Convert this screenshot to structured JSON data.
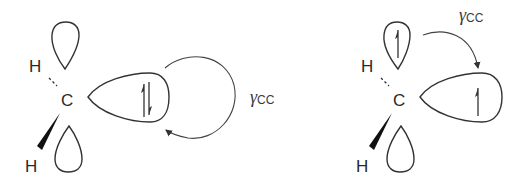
{
  "diagram": {
    "panels": [
      {
        "id": "left",
        "central_atom": "C",
        "substituents": [
          "H",
          "H"
        ],
        "lobe_electrons": "paired (up/down)",
        "arrow_label": {
          "symbol": "γ",
          "subscript": "CC"
        }
      },
      {
        "id": "right",
        "central_atom": "C",
        "substituents": [
          "H",
          "H"
        ],
        "lobe_electrons": "single up",
        "arrow_label": {
          "symbol": "γ",
          "subscript": "CC"
        }
      }
    ],
    "colors": {
      "stroke": "#333333",
      "background": "#ffffff"
    }
  }
}
